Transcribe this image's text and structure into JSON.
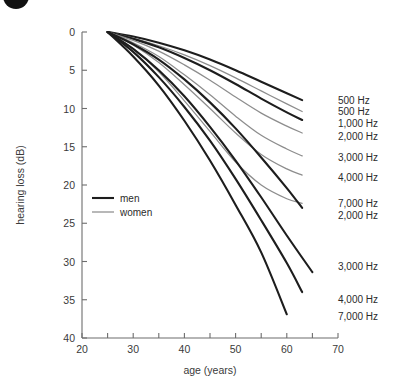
{
  "chart_data": {
    "type": "line",
    "title": "",
    "xlabel": "age (years)",
    "ylabel": "hearing loss (dB)",
    "xlim": [
      20,
      70
    ],
    "ylim": [
      40,
      0
    ],
    "y_inverted": true,
    "grid": false,
    "xticks": [
      20,
      25,
      30,
      35,
      40,
      45,
      50,
      55,
      60,
      65,
      70
    ],
    "xtick_labels": [
      "20",
      "",
      "30",
      "",
      "40",
      "",
      "50",
      "",
      "60",
      "",
      "70"
    ],
    "yticks": [
      0,
      5,
      10,
      15,
      20,
      25,
      30,
      35,
      40
    ],
    "ytick_labels": [
      "0",
      "5",
      "10",
      "15",
      "20",
      "25",
      "30",
      "35",
      "40"
    ],
    "legend": {
      "position": "inside-left",
      "entries": [
        {
          "name": "men",
          "color": "#1d1d1d",
          "width": "thick"
        },
        {
          "name": "women",
          "color": "#8d8d8d",
          "width": "thin"
        }
      ]
    },
    "series": [
      {
        "name": "500 Hz",
        "group": "men",
        "end_label": "500 Hz",
        "color": "#1d1d1d",
        "x": [
          25,
          30,
          35,
          40,
          45,
          50,
          55,
          60,
          63
        ],
        "y": [
          0.0,
          0.6,
          1.4,
          2.4,
          3.6,
          5.0,
          6.5,
          8.0,
          8.9
        ]
      },
      {
        "name": "500 Hz women",
        "group": "women",
        "end_label": "500 Hz",
        "color": "#8d8d8d",
        "x": [
          25,
          30,
          35,
          40,
          45,
          50,
          55,
          60,
          63
        ],
        "y": [
          0.0,
          0.8,
          1.8,
          3.0,
          4.4,
          6.0,
          7.7,
          9.4,
          10.4
        ]
      },
      {
        "name": "1,000 Hz",
        "group": "men",
        "end_label": "1,000 Hz",
        "color": "#1d1d1d",
        "x": [
          25,
          30,
          35,
          40,
          45,
          50,
          55,
          60,
          63
        ],
        "y": [
          0.0,
          0.9,
          2.0,
          3.4,
          5.0,
          6.8,
          8.7,
          10.5,
          11.5
        ]
      },
      {
        "name": "2,000 Hz women",
        "group": "women",
        "end_label": "2,000 Hz",
        "color": "#8d8d8d",
        "x": [
          25,
          30,
          35,
          40,
          45,
          50,
          55,
          60,
          63
        ],
        "y": [
          0.0,
          1.1,
          2.5,
          4.3,
          6.3,
          8.5,
          10.6,
          12.3,
          13.2
        ]
      },
      {
        "name": "3,000 Hz women",
        "group": "women",
        "end_label": "3,000 Hz",
        "color": "#8d8d8d",
        "x": [
          25,
          30,
          35,
          40,
          45,
          50,
          55,
          60,
          63
        ],
        "y": [
          0.0,
          1.4,
          3.2,
          5.6,
          8.2,
          11.0,
          13.5,
          15.3,
          16.2
        ]
      },
      {
        "name": "4,000 Hz women",
        "group": "women",
        "end_label": "4,000 Hz",
        "color": "#8d8d8d",
        "x": [
          25,
          30,
          35,
          40,
          45,
          50,
          55,
          60,
          63
        ],
        "y": [
          0.0,
          1.7,
          4.0,
          6.9,
          10.0,
          13.2,
          16.0,
          17.9,
          18.7
        ]
      },
      {
        "name": "7,000 Hz women",
        "group": "women",
        "end_label": "7,000 Hz",
        "color": "#8d8d8d",
        "x": [
          25,
          30,
          35,
          40,
          45,
          50,
          55,
          60,
          63
        ],
        "y": [
          0.0,
          2.2,
          5.2,
          9.0,
          13.0,
          17.0,
          20.0,
          21.8,
          22.4
        ]
      },
      {
        "name": "2,000 Hz",
        "group": "men",
        "end_label": "2,000 Hz",
        "color": "#1d1d1d",
        "x": [
          25,
          30,
          35,
          40,
          45,
          50,
          55,
          60,
          63
        ],
        "y": [
          0.0,
          1.6,
          3.6,
          6.2,
          9.2,
          12.6,
          16.4,
          20.4,
          23.0
        ]
      },
      {
        "name": "3,000 Hz",
        "group": "men",
        "end_label": "3,000 Hz",
        "color": "#1d1d1d",
        "x": [
          25,
          30,
          35,
          40,
          45,
          50,
          55,
          60,
          65
        ],
        "y": [
          0.0,
          2.2,
          5.0,
          8.4,
          12.4,
          16.8,
          21.6,
          26.6,
          31.4
        ]
      },
      {
        "name": "4,000 Hz",
        "group": "men",
        "end_label": "4,000 Hz",
        "color": "#1d1d1d",
        "x": [
          25,
          30,
          35,
          40,
          45,
          50,
          55,
          60,
          63
        ],
        "y": [
          0.0,
          2.6,
          5.9,
          9.8,
          14.2,
          19.2,
          24.6,
          30.2,
          34.0
        ]
      },
      {
        "name": "7,000 Hz",
        "group": "men",
        "end_label": "7,000 Hz",
        "color": "#1d1d1d",
        "x": [
          25,
          30,
          35,
          40,
          45,
          50,
          55,
          60
        ],
        "y": [
          0.0,
          3.2,
          7.0,
          11.6,
          16.8,
          22.6,
          28.8,
          36.9
        ]
      }
    ],
    "end_labels": [
      {
        "text": "500 Hz",
        "y_value": 8.9
      },
      {
        "text": "500 Hz",
        "y_value": 10.4
      },
      {
        "text": "1,000 Hz",
        "y_value": 11.9
      },
      {
        "text": "2,000 Hz",
        "y_value": 13.6
      },
      {
        "text": "3,000 Hz",
        "y_value": 16.4
      },
      {
        "text": "4,000 Hz",
        "y_value": 19.0
      },
      {
        "text": "7,000 Hz",
        "y_value": 22.4
      },
      {
        "text": "2,000 Hz",
        "y_value": 24.0
      },
      {
        "text": "3,000 Hz",
        "y_value": 30.6
      },
      {
        "text": "4,000 Hz",
        "y_value": 35.0
      },
      {
        "text": "7,000 Hz",
        "y_value": 37.2
      }
    ]
  }
}
